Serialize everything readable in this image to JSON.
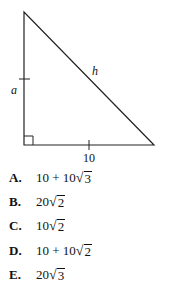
{
  "figure": {
    "shape": "right-triangle",
    "labels": {
      "vertical_leg": "a",
      "hypotenuse": "h",
      "horizontal_leg": "10"
    },
    "right_angle_marker": true,
    "tick_marks": [
      "vertical_leg",
      "horizontal_leg"
    ]
  },
  "choices": [
    {
      "letter": "A.",
      "prefix": "10 + 10",
      "radicand": "3"
    },
    {
      "letter": "B.",
      "prefix": "20",
      "radicand": "2"
    },
    {
      "letter": "C.",
      "prefix": "10",
      "radicand": "2"
    },
    {
      "letter": "D.",
      "prefix": "10 + 10",
      "radicand": "2"
    },
    {
      "letter": "E.",
      "prefix": "20",
      "radicand": "3"
    }
  ]
}
